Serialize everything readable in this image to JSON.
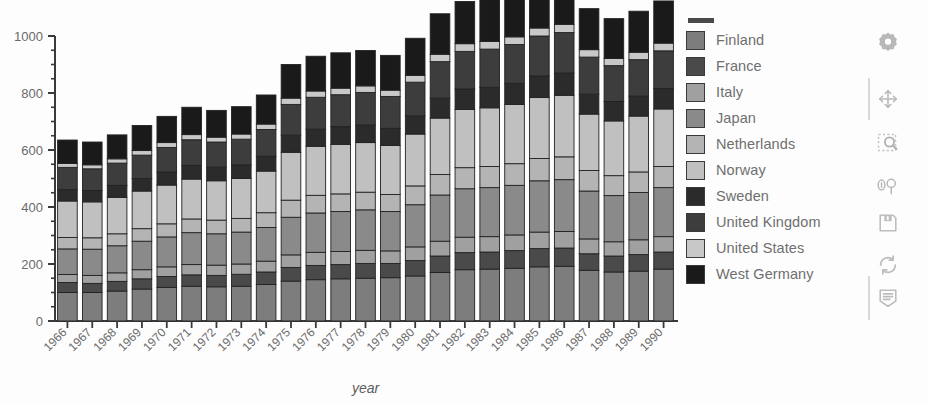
{
  "chart_data": {
    "type": "bar",
    "subtype": "stacked-bar",
    "title": "",
    "xlabel": "year",
    "ylabel": "",
    "ylim": [
      0,
      1000
    ],
    "yticks": [
      0,
      200,
      400,
      600,
      800,
      1000
    ],
    "ytick_labels": [
      "0",
      "200",
      "400",
      "600",
      "800",
      "1000"
    ],
    "minor_tick_step": 50,
    "grid": false,
    "legend_position": "right",
    "categories": [
      "1966",
      "1967",
      "1968",
      "1969",
      "1970",
      "1971",
      "1972",
      "1973",
      "1974",
      "1975",
      "1976",
      "1977",
      "1978",
      "1979",
      "1980",
      "1981",
      "1982",
      "1983",
      "1984",
      "1985",
      "1986",
      "1987",
      "1988",
      "1989",
      "1990"
    ],
    "series": [
      {
        "name": "Finland",
        "color": "#7d7d7d",
        "values": [
          100,
          100,
          105,
          112,
          118,
          122,
          120,
          122,
          128,
          140,
          145,
          148,
          150,
          152,
          158,
          170,
          180,
          182,
          185,
          190,
          192,
          178,
          172,
          175,
          182
        ]
      },
      {
        "name": "France",
        "color": "#4a4a4a",
        "values": [
          35,
          32,
          34,
          36,
          38,
          40,
          40,
          42,
          44,
          48,
          50,
          50,
          52,
          50,
          54,
          58,
          60,
          60,
          62,
          64,
          64,
          58,
          56,
          58,
          60
        ]
      },
      {
        "name": "Italy",
        "color": "#a0a0a0",
        "values": [
          28,
          28,
          30,
          32,
          34,
          36,
          36,
          36,
          38,
          44,
          46,
          46,
          46,
          44,
          48,
          52,
          54,
          54,
          55,
          58,
          58,
          52,
          50,
          52,
          54
        ]
      },
      {
        "name": "Japan",
        "color": "#8a8a8a",
        "values": [
          90,
          92,
          95,
          100,
          105,
          112,
          110,
          112,
          118,
          132,
          138,
          140,
          142,
          138,
          148,
          162,
          170,
          172,
          174,
          180,
          182,
          168,
          162,
          166,
          172
        ]
      },
      {
        "name": "Netherlands",
        "color": "#b4b4b4",
        "values": [
          40,
          40,
          42,
          44,
          46,
          48,
          48,
          48,
          52,
          60,
          62,
          62,
          62,
          60,
          66,
          72,
          74,
          74,
          76,
          78,
          80,
          72,
          70,
          72,
          74
        ]
      },
      {
        "name": "Norway",
        "color": "#c0c0c0",
        "values": [
          128,
          126,
          128,
          132,
          136,
          140,
          138,
          140,
          146,
          168,
          172,
          174,
          174,
          172,
          182,
          198,
          204,
          206,
          208,
          214,
          216,
          198,
          192,
          196,
          202
        ]
      },
      {
        "name": "Sweden",
        "color": "#2b2b2b",
        "values": [
          40,
          40,
          42,
          44,
          46,
          48,
          48,
          48,
          52,
          60,
          60,
          62,
          62,
          60,
          64,
          70,
          72,
          72,
          74,
          76,
          78,
          70,
          68,
          70,
          72
        ]
      },
      {
        "name": "United Kingdom",
        "color": "#3d3d3d",
        "values": [
          78,
          76,
          78,
          82,
          86,
          90,
          88,
          90,
          94,
          108,
          112,
          112,
          114,
          112,
          118,
          128,
          132,
          134,
          136,
          140,
          142,
          130,
          126,
          128,
          132
        ]
      },
      {
        "name": "United States",
        "color": "#c8c8c8",
        "values": [
          14,
          14,
          15,
          16,
          17,
          18,
          17,
          18,
          19,
          22,
          22,
          23,
          23,
          22,
          24,
          26,
          27,
          27,
          27,
          28,
          29,
          26,
          25,
          26,
          27
        ]
      },
      {
        "name": "West Germany",
        "color": "#1a1a1a",
        "values": [
          82,
          80,
          84,
          88,
          92,
          96,
          94,
          96,
          102,
          118,
          122,
          124,
          124,
          122,
          130,
          142,
          148,
          148,
          150,
          156,
          158,
          144,
          140,
          144,
          148
        ]
      }
    ],
    "totals": [
      635,
      628,
      653,
      686,
      718,
      750,
      739,
      752,
      793,
      900,
      929,
      941,
      949,
      932,
      992,
      1078,
      1121,
      1129,
      1147,
      1184,
      1199,
      1096,
      1061,
      1087,
      1123
    ]
  },
  "legend": {
    "title_dash": "",
    "items": [
      {
        "label": "Finland"
      },
      {
        "label": "France"
      },
      {
        "label": "Italy"
      },
      {
        "label": "Japan"
      },
      {
        "label": "Netherlands"
      },
      {
        "label": "Norway"
      },
      {
        "label": "Sweden"
      },
      {
        "label": "United Kingdom"
      },
      {
        "label": "United States"
      },
      {
        "label": "West Germany"
      }
    ]
  },
  "toolbar": {
    "items": [
      {
        "name": "settings-gear-icon",
        "label": "Settings"
      },
      {
        "name": "pan-move-icon",
        "label": "Pan"
      },
      {
        "name": "zoom-rect-icon",
        "label": "Zoom to rectangle"
      },
      {
        "name": "subplot-config-icon",
        "label": "Configure subplots"
      },
      {
        "name": "save-floppy-icon",
        "label": "Save figure"
      },
      {
        "name": "refresh-icon",
        "label": "Reset view"
      },
      {
        "name": "notes-document-icon",
        "label": "Notes"
      }
    ]
  },
  "colors": {
    "background": "#fdfdfd",
    "axis": "#3a3a3a",
    "tick_text": "#6a6a6a",
    "legend_text": "#6f6f6f",
    "toolbar_icon": "#bdbdbd"
  }
}
